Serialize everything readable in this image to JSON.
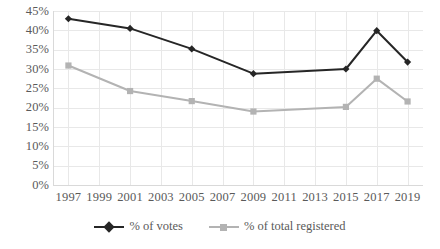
{
  "chart_data": {
    "type": "line",
    "title": "",
    "subtitle": "",
    "xlabel": "",
    "ylabel": "",
    "x": [
      1997,
      2001,
      2005,
      2009,
      2015,
      2017,
      2019
    ],
    "x_tick_labels": [
      "1997",
      "1999",
      "2001",
      "2003",
      "2005",
      "2007",
      "2009",
      "2011",
      "2013",
      "2015",
      "2017",
      "2019"
    ],
    "y_tick_labels": [
      "45%",
      "40%",
      "35%",
      "30%",
      "25%",
      "20%",
      "15%",
      "10%",
      "5%",
      "0%"
    ],
    "y_tick_values": [
      45,
      40,
      35,
      30,
      25,
      20,
      15,
      10,
      5,
      0
    ],
    "ylim": [
      0,
      45
    ],
    "xlim": [
      1996,
      2020
    ],
    "grid": true,
    "legend_position": "bottom",
    "series": [
      {
        "name": "% of votes",
        "color": "#262626",
        "marker": "diamond",
        "x": [
          1997,
          2001,
          2005,
          2009,
          2015,
          2017,
          2019
        ],
        "values": [
          43.0,
          40.5,
          35.2,
          28.8,
          30.0,
          39.9,
          31.8
        ]
      },
      {
        "name": "% of total registered",
        "color": "#b3b3b3",
        "marker": "square",
        "x": [
          1997,
          2001,
          2005,
          2009,
          2015,
          2017,
          2019
        ],
        "values": [
          30.9,
          24.3,
          21.7,
          19.0,
          20.2,
          27.5,
          21.6
        ]
      }
    ],
    "colors": {
      "series_votes": "#262626",
      "series_registered": "#b3b3b3",
      "gridline": "#e8e8e8",
      "axis": "#d9d9d9",
      "tick_text": "#5a5a5a",
      "background": "#ffffff"
    }
  },
  "legend": {
    "items": [
      {
        "label": "% of votes"
      },
      {
        "label": "% of total registered"
      }
    ]
  }
}
